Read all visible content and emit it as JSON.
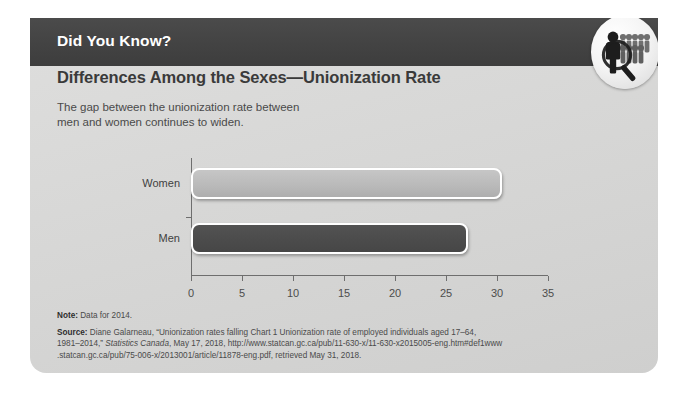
{
  "header": {
    "title": "Did You Know?",
    "badge_icon": "people-magnifier-icon",
    "bar_color": "#434343"
  },
  "content": {
    "title": "Differences Among the Sexes—Unionization Rate",
    "subtitle_line1": "The gap between the unionization rate between",
    "subtitle_line2": "men and women continues to widen."
  },
  "chart_data": {
    "type": "bar",
    "orientation": "horizontal",
    "title": "",
    "xlabel": "",
    "ylabel": "",
    "categories": [
      "Women",
      "Men"
    ],
    "values": [
      30.5,
      27.2
    ],
    "xticks": [
      "0",
      "5",
      "10",
      "15",
      "20",
      "25",
      "30",
      "35"
    ],
    "xtick_values": [
      0,
      5,
      10,
      15,
      20,
      25,
      30,
      35
    ],
    "xlim": [
      0,
      35
    ],
    "grid": false,
    "legend": false,
    "colors": {
      "Women": "#b9b9b9",
      "Men": "#4b4b4b",
      "bar_outline": "#ffffff",
      "axis": "#6e6e6e"
    }
  },
  "footnotes": {
    "note_label": "Note:",
    "note_text": " Data for 2014.",
    "source_label": "Source:",
    "source_line1_a": " Diane Galarneau, “Unionization rates falling  Chart 1 Unionization rate of employed individuals aged 17–64,",
    "source_line2_a": "1981–2014,” ",
    "source_line2_italic": "Statistics Canada",
    "source_line2_b": ", May 17, 2018, http://www.statcan.gc.ca/pub/11-630-x/11-630-x2015005-eng.htm#def1www",
    "source_line3": ".statcan.gc.ca/pub/75-006-x/2013001/article/11878-eng.pdf, retrieved May 31, 2018."
  }
}
